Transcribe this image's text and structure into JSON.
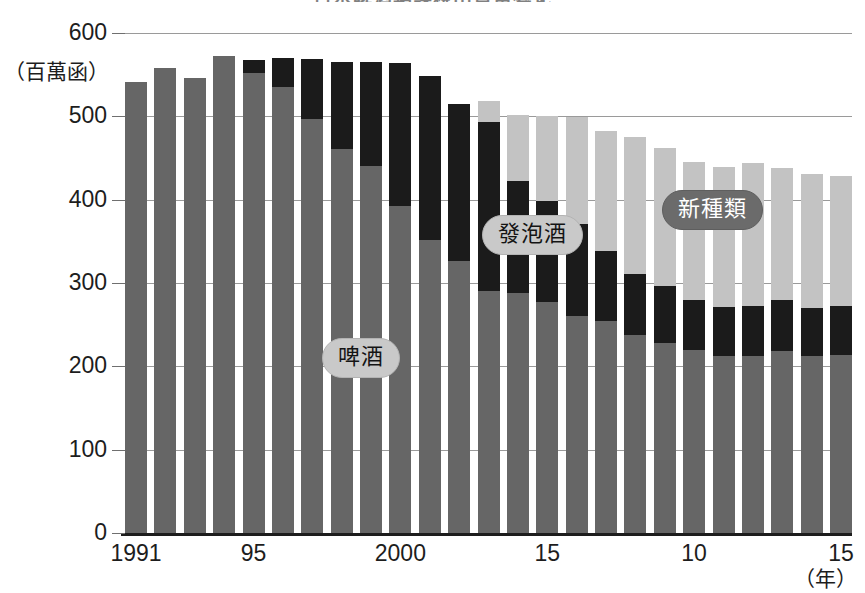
{
  "title": "日本啤酒類課稅出貨量變化",
  "axes": {
    "y_unit_label": "（百萬函）",
    "y_ticks": [
      600,
      500,
      400,
      300,
      200,
      100,
      0
    ],
    "x_unit_label": "（年）",
    "x_tick_labels": [
      {
        "label": "1991",
        "bar_index": 0
      },
      {
        "label": "95",
        "bar_index": 4
      },
      {
        "label": "2000",
        "bar_index": 9
      },
      {
        "label": "15",
        "bar_index": 14
      },
      {
        "label": "10",
        "bar_index": 19
      },
      {
        "label": "15",
        "bar_index": 24
      }
    ]
  },
  "legend": [
    {
      "name": "beer",
      "label": "啤酒",
      "color": "#666666",
      "style": "light"
    },
    {
      "name": "happoshu",
      "label": "發泡酒",
      "color": "#1b1b1b",
      "style": "light"
    },
    {
      "name": "new-genre",
      "label": "新種類",
      "color": "#c3c3c3",
      "style": "dark"
    }
  ],
  "chart_data": {
    "type": "bar",
    "stacked": true,
    "title": "日本啤酒類課稅出貨量變化",
    "xlabel": "（年）",
    "ylabel": "（百萬函）",
    "ylim": [
      0,
      600
    ],
    "ytick_step": 100,
    "grid": true,
    "legend_position": "inline-annotations",
    "categories": [
      "1991",
      "1992",
      "1993",
      "1994",
      "1995",
      "1996",
      "1997",
      "1998",
      "1999",
      "2000",
      "2001",
      "2002",
      "2003",
      "2004",
      "2005",
      "2006",
      "2007",
      "2008",
      "2009",
      "2010",
      "2011",
      "2012",
      "2013",
      "2014",
      "2015"
    ],
    "series": [
      {
        "name": "啤酒",
        "color": "#666666",
        "values": [
          541,
          558,
          546,
          572,
          552,
          535,
          497,
          461,
          441,
          392,
          352,
          327,
          291,
          288,
          277,
          260,
          254,
          238,
          228,
          220,
          212,
          212,
          218,
          212,
          214
        ]
      },
      {
        "name": "發泡酒",
        "color": "#1b1b1b",
        "values": [
          0,
          0,
          0,
          0,
          16,
          35,
          72,
          104,
          124,
          172,
          196,
          188,
          202,
          134,
          122,
          111,
          85,
          73,
          68,
          60,
          59,
          60,
          62,
          58,
          58
        ]
      },
      {
        "name": "新種類",
        "color": "#c3c3c3",
        "values": [
          0,
          0,
          0,
          0,
          0,
          0,
          0,
          0,
          0,
          0,
          0,
          0,
          26,
          80,
          101,
          128,
          144,
          164,
          166,
          165,
          168,
          172,
          158,
          161,
          157
        ]
      }
    ],
    "totals": [
      541,
      558,
      546,
      572,
      568,
      570,
      569,
      565,
      565,
      564,
      548,
      515,
      519,
      502,
      500,
      499,
      483,
      475,
      462,
      445,
      439,
      444,
      438,
      431,
      429
    ]
  }
}
